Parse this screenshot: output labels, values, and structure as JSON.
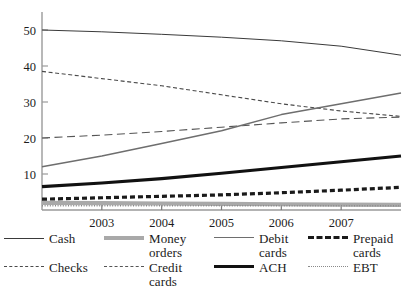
{
  "chart_data": {
    "type": "line",
    "title": "",
    "xlabel": "",
    "ylabel": "",
    "x": [
      2002,
      2003,
      2004,
      2005,
      2006,
      2007,
      2008
    ],
    "xlim": [
      2002,
      2008
    ],
    "ylim": [
      0,
      55
    ],
    "yticks": [
      10,
      20,
      30,
      40,
      50
    ],
    "xticks": [
      2003,
      2004,
      2005,
      2006,
      2007
    ],
    "xtick_labels": [
      "2003",
      "2004",
      "2005",
      "2006",
      "2007"
    ],
    "ytick_labels": [
      "10",
      "20",
      "30",
      "40",
      "50"
    ],
    "grid": false,
    "legend_position": "bottom",
    "series": [
      {
        "name": "Cash",
        "style": "solid-thin",
        "color": "#3a3a3a",
        "values": [
          50.0,
          49.5,
          48.8,
          48.0,
          47.0,
          45.5,
          43.0
        ]
      },
      {
        "name": "Money orders",
        "style": "solid-thick-gray",
        "color": "#a9a9a9",
        "values": [
          2.0,
          1.9,
          1.8,
          1.7,
          1.6,
          1.5,
          1.4
        ]
      },
      {
        "name": "Debit cards",
        "style": "solid-medium-gray",
        "color": "#6e6e6e",
        "values": [
          12.0,
          15.0,
          18.5,
          22.0,
          26.5,
          29.5,
          32.5
        ]
      },
      {
        "name": "Prepaid cards",
        "style": "dashed-thick",
        "color": "#1a1a1a",
        "values": [
          3.0,
          3.4,
          3.8,
          4.2,
          4.8,
          5.5,
          6.3
        ]
      },
      {
        "name": "Checks",
        "style": "dashed-short-thin",
        "color": "#4a4a4a",
        "values": [
          38.5,
          36.5,
          34.5,
          32.0,
          29.5,
          27.5,
          26.0
        ]
      },
      {
        "name": "Credit cards",
        "style": "dashed-long-thin",
        "color": "#555555",
        "values": [
          20.0,
          20.8,
          21.8,
          23.0,
          24.2,
          25.3,
          25.8
        ]
      },
      {
        "name": "ACH",
        "style": "solid-thick-black",
        "color": "#111111",
        "values": [
          6.5,
          7.5,
          8.7,
          10.2,
          11.8,
          13.4,
          15.0
        ]
      },
      {
        "name": "EBT",
        "style": "dotted-thin",
        "color": "#8a8a8a",
        "values": [
          1.2,
          1.2,
          1.2,
          1.2,
          1.2,
          1.2,
          1.2
        ]
      }
    ]
  },
  "legend": {
    "rows": [
      [
        {
          "label": "Cash",
          "swatch": "cash"
        },
        {
          "label": "Money orders",
          "swatch": "money-orders"
        },
        {
          "label": "Debit\ncards",
          "swatch": "debit-cards"
        },
        {
          "label": "Prepaid\ncards",
          "swatch": "prepaid-cards"
        }
      ],
      [
        {
          "label": "Checks",
          "swatch": "checks"
        },
        {
          "label": "Credit cards",
          "swatch": "credit-cards"
        },
        {
          "label": "ACH",
          "swatch": "ach"
        },
        {
          "label": "EBT",
          "swatch": "ebt"
        }
      ]
    ]
  }
}
